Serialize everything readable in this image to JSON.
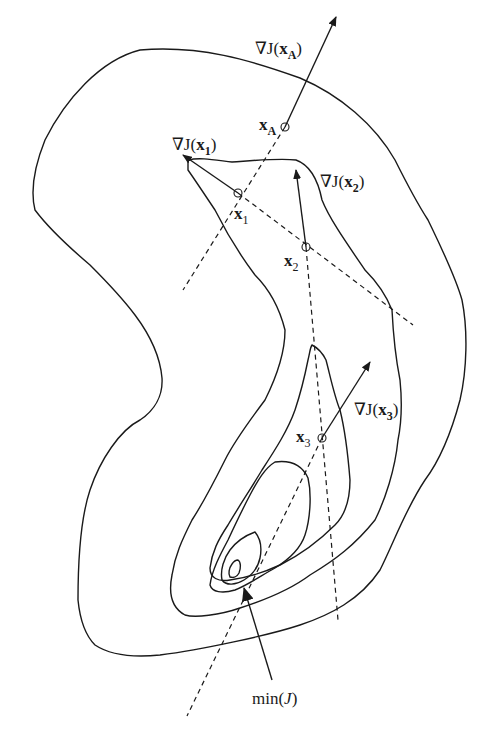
{
  "figure": {
    "colors": {
      "background": "#ffffff",
      "level_outer": "#ffffff",
      "level_1": "#d9d9d9",
      "level_2": "#d9d9d9",
      "level_3": "#9a9a9a",
      "level_4": "#8a8a8a",
      "level_5": "#3a3a3a",
      "stroke": "#1a1a1a"
    },
    "points": [
      {
        "id": "xA",
        "label": "x",
        "subscript": "A",
        "gradient_label_prefix": "∇J(",
        "gradient_label_var": "x",
        "gradient_label_sub": "A",
        "gradient_label_suffix": ")"
      },
      {
        "id": "x1",
        "label": "x",
        "subscript": "1",
        "gradient_label_prefix": "∇J(",
        "gradient_label_var": "x",
        "gradient_label_sub": "1",
        "gradient_label_suffix": ")"
      },
      {
        "id": "x2",
        "label": "x",
        "subscript": "2",
        "gradient_label_prefix": "∇J(",
        "gradient_label_var": "x",
        "gradient_label_sub": "2",
        "gradient_label_suffix": ")"
      },
      {
        "id": "x3",
        "label": "x",
        "subscript": "3",
        "gradient_label_prefix": "∇J(",
        "gradient_label_var": "x",
        "gradient_label_sub": "3",
        "gradient_label_suffix": ")"
      }
    ],
    "minimum": {
      "label_prefix": "min(",
      "label_var": "J",
      "label_suffix": ")"
    }
  }
}
